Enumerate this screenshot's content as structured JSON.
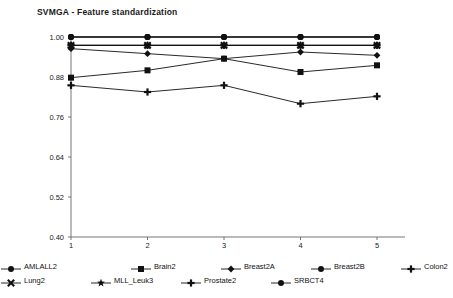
{
  "chart_data": {
    "type": "line",
    "title": "SVMGA - Feature standardization",
    "xlabel": "",
    "ylabel": "",
    "x": [
      1,
      2,
      3,
      4,
      5
    ],
    "xtick_labels": [
      "1",
      "2",
      "3",
      "4",
      "5"
    ],
    "ytick_labels": [
      "0.40",
      "0.52",
      "0.64",
      "0.76",
      "0.88",
      "1.00"
    ],
    "ytick_values": [
      0.4,
      0.52,
      0.64,
      0.76,
      0.88,
      1.0
    ],
    "ylim": [
      0.4,
      1.0
    ],
    "xlim": [
      1,
      5
    ],
    "grid": false,
    "legend_position": "bottom",
    "series": [
      {
        "name": "AMLALL2",
        "marker": "circle",
        "values": [
          1.0,
          1.0,
          1.0,
          1.0,
          1.0
        ]
      },
      {
        "name": "Brain2",
        "marker": "square",
        "values": [
          0.878,
          0.9,
          0.935,
          0.895,
          0.915
        ]
      },
      {
        "name": "Breast2A",
        "marker": "diamond",
        "values": [
          0.965,
          0.95,
          0.935,
          0.955,
          0.945
        ]
      },
      {
        "name": "Breast2B",
        "marker": "circle",
        "values": [
          1.0,
          1.0,
          1.0,
          1.0,
          1.0
        ]
      },
      {
        "name": "Colon2",
        "marker": "plus",
        "values": [
          0.855,
          0.835,
          0.855,
          0.8,
          0.822
        ]
      },
      {
        "name": "Lung2",
        "marker": "xcross",
        "values": [
          0.975,
          0.975,
          0.975,
          0.975,
          0.975
        ]
      },
      {
        "name": "MLL_Leuk3",
        "marker": "star",
        "values": [
          0.975,
          0.975,
          0.975,
          0.975,
          0.975
        ]
      },
      {
        "name": "Prostate2",
        "marker": "plus",
        "values": [
          0.975,
          0.975,
          0.975,
          0.975,
          0.975
        ]
      },
      {
        "name": "SRBCT4",
        "marker": "circle",
        "values": [
          1.0,
          1.0,
          1.0,
          1.0,
          1.0
        ]
      }
    ]
  },
  "legend": {
    "row1": [
      {
        "label": "AMLALL2",
        "marker": "circle"
      },
      {
        "label": "Brain2",
        "marker": "square"
      },
      {
        "label": "Breast2A",
        "marker": "diamond"
      },
      {
        "label": "Breast2B",
        "marker": "circle"
      },
      {
        "label": "Colon2",
        "marker": "plus"
      }
    ],
    "row2": [
      {
        "label": "Lung2",
        "marker": "xcross"
      },
      {
        "label": "MLL_Leuk3",
        "marker": "star"
      },
      {
        "label": "Prostate2",
        "marker": "plus"
      },
      {
        "label": "SRBCT4",
        "marker": "circle"
      }
    ]
  },
  "colors": {
    "line": "#111111",
    "axis": "#666666",
    "text": "#111111",
    "background": "#ffffff"
  }
}
